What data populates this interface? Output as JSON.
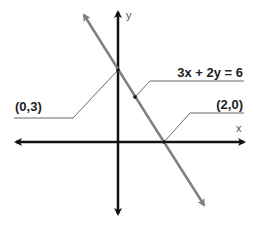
{
  "diagram": {
    "equation_label": "3x + 2y = 6",
    "y_intercept_label": "(0,3)",
    "x_intercept_label": "(2,0)",
    "x_axis_label": "x",
    "y_axis_label": "y",
    "colors": {
      "axes": "#111111",
      "line": "#808080",
      "leader": "#444444",
      "background": "#ffffff"
    }
  }
}
